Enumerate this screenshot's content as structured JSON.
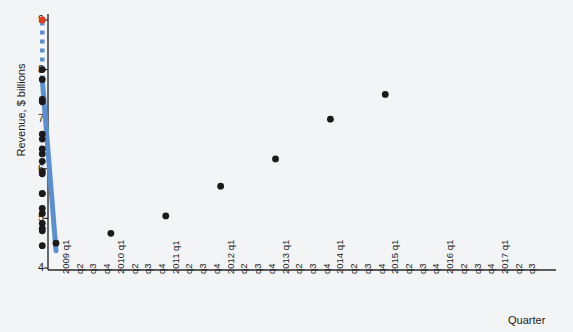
{
  "chart_data": {
    "type": "scatter",
    "title": "",
    "xlabel": "Quarter",
    "ylabel": "Revenue, $ billions",
    "ylim": [
      4,
      9
    ],
    "yticks": [
      4,
      5,
      6,
      7,
      8,
      9
    ],
    "grid": false,
    "legend": "none",
    "categories": [
      "2009 q1",
      "q2",
      "q3",
      "q4",
      "2010 q1",
      "q2",
      "q3",
      "q4",
      "2011 q1",
      "q2",
      "q3",
      "q4",
      "2012 q1",
      "q2",
      "q3",
      "q4",
      "2013 q1",
      "q2",
      "q3",
      "q4",
      "2014 q1",
      "q2",
      "q3",
      "q4",
      "2015 q1",
      "q2",
      "q3",
      "q4",
      "2016 q1",
      "q2",
      "q3",
      "q4",
      "2017 q1",
      "q2",
      "q3"
    ],
    "year_labels": [
      "2009",
      "2010",
      "2011",
      "2012",
      "2013",
      "2014",
      "2015",
      "2016",
      "2017"
    ],
    "quarter_labels": [
      "q1",
      "q2",
      "q3",
      "q4"
    ],
    "series": [
      {
        "name": "Observed revenue",
        "type": "scatter",
        "color": "#1a1a1a",
        "x": [
          "2009 q1",
          "2009 q2",
          "2009 q3",
          "2009 q4",
          "2010 q1",
          "2010 q2",
          "2010 q3",
          "2010 q4",
          "2011 q1",
          "2011 q2",
          "2011 q3",
          "2011 q4",
          "2012 q1",
          "2012 q2",
          "2012 q3",
          "2012 q4",
          "2013 q1",
          "2013 q2",
          "2013 q3",
          "2013 q4",
          "2014 q1",
          "2014 q2",
          "2014 q3",
          "2014 q4",
          "2015 q1",
          "2015 q2"
        ],
        "values": [
          4.5,
          4.75,
          4.9,
          4.45,
          4.7,
          5.1,
          5.2,
          4.8,
          5.05,
          5.5,
          5.9,
          5.5,
          5.65,
          6.15,
          6.4,
          5.95,
          6.2,
          6.7,
          6.6,
          6.3,
          7.0,
          7.4,
          8.0,
          7.35,
          7.5,
          7.8
        ]
      },
      {
        "name": "Trend line (fitted)",
        "type": "line",
        "style": "solid",
        "color": "#5b8fd0",
        "x_start": "2009 q1",
        "x_end": "2015 q2",
        "y_start": 4.35,
        "y_end": 7.8
      },
      {
        "name": "Trend line (forecast)",
        "type": "line",
        "style": "dotted",
        "color": "#5b8fd0",
        "x_start": "2015 q2",
        "x_end": "2017 q3",
        "y_start": 7.8,
        "y_end": 9.0
      },
      {
        "name": "Forecast point",
        "type": "scatter",
        "color": "#e03a21",
        "x": [
          "2017 q3"
        ],
        "values": [
          9.0
        ]
      }
    ]
  },
  "axes": {
    "y_title": "Revenue, $ billions",
    "x_title": "Quarter"
  }
}
